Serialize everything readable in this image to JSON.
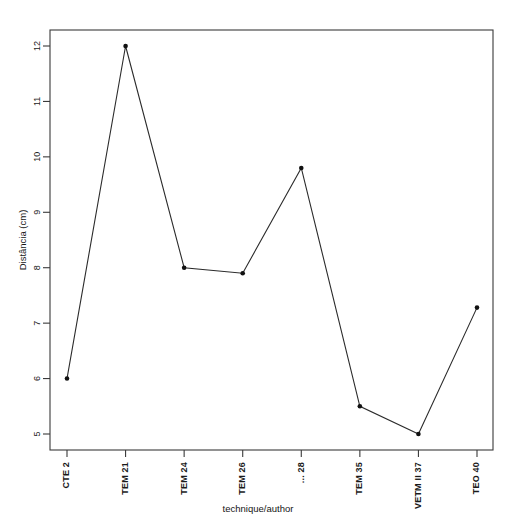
{
  "chart_data": {
    "type": "line",
    "title": "",
    "xlabel": "technique/author",
    "ylabel": "Distância (cm)",
    "categories": [
      "CTE 2",
      "TEM 21",
      "TEM 24",
      "TEM 26",
      "... 28",
      "TEM 35",
      "VETM II 37",
      "TEO 40"
    ],
    "values": [
      6.0,
      12.0,
      8.0,
      7.9,
      9.8,
      5.5,
      5.0,
      7.28
    ],
    "ytick_labels": [
      "5",
      "6",
      "7",
      "8",
      "9",
      "10",
      "11",
      "12"
    ],
    "ytick_values": [
      5,
      6,
      7,
      8,
      9,
      10,
      11,
      12
    ],
    "ylim": [
      4.7,
      12.3
    ],
    "xlim": [
      0.6,
      8.4
    ],
    "grid": false,
    "legend": null,
    "marker": "filled-circle",
    "line_color": "#2b2b2b",
    "marker_color": "#111111",
    "axis_color": "#3a3a3a",
    "background_color": "#ffffff"
  },
  "figure": {
    "frame": "rectangle-box",
    "orientation": "portrait"
  }
}
